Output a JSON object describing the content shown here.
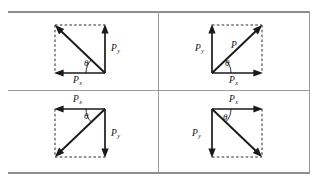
{
  "figure": {
    "layout": "2x2 grid of quadrant diagrams",
    "frame_color": "#9a9a9a",
    "vector_color": "#1a1a1a",
    "construction_line_style": "dashed",
    "panels": [
      {
        "id": "top-left",
        "quadrant": "second",
        "origin_corner": "bottom-right",
        "resultant_direction": "up-left",
        "resultant_label": "",
        "x_component_label": "P",
        "x_component_subscript": "x",
        "x_component_direction": "left",
        "y_component_label": "P",
        "y_component_subscript": "y",
        "y_component_direction": "up",
        "angle_label": "θ"
      },
      {
        "id": "top-right",
        "quadrant": "first",
        "origin_corner": "bottom-left",
        "resultant_direction": "up-right",
        "resultant_label": "P",
        "x_component_label": "P",
        "x_component_subscript": "x",
        "x_component_direction": "right",
        "y_component_label": "P",
        "y_component_subscript": "y",
        "y_component_direction": "up",
        "angle_label": "θ"
      },
      {
        "id": "bottom-left",
        "quadrant": "third",
        "origin_corner": "top-right",
        "resultant_direction": "down-left",
        "resultant_label": "",
        "x_component_label": "P",
        "x_component_subscript": "x",
        "x_component_direction": "left",
        "y_component_label": "P",
        "y_component_subscript": "y",
        "y_component_direction": "down",
        "angle_label": "θ"
      },
      {
        "id": "bottom-right",
        "quadrant": "fourth",
        "origin_corner": "top-left",
        "resultant_direction": "down-right",
        "resultant_label": "",
        "x_component_label": "P",
        "x_component_subscript": "x",
        "x_component_direction": "right",
        "y_component_label": "P",
        "y_component_subscript": "y",
        "y_component_direction": "down",
        "angle_label": "θ"
      }
    ]
  }
}
